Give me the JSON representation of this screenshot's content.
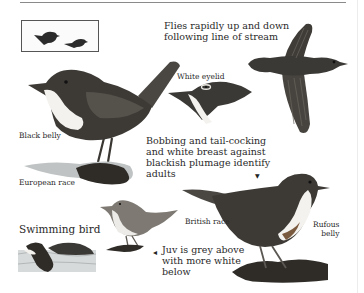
{
  "labels": {
    "flight": [
      "Flies rapidly up and down",
      "following line of stream"
    ],
    "white_eyelid": "White eyelid",
    "black_belly": "Black belly",
    "european_race": "European race",
    "bobbing": [
      "Bobbing and tail-cocking",
      "and white breast against",
      "blackish plumage identify",
      "adults"
    ],
    "british_race": "British race",
    "rufous_belly": [
      "Rufous",
      "belly"
    ],
    "swimming_bird": "Swimming bird",
    "juvenile": [
      "Juv is grey above",
      "with more white",
      "below"
    ]
  },
  "pointers": {
    "adult_marker": "▼",
    "juv_marker": "•",
    "juv_arrow": "◂"
  },
  "colors": {
    "plumage_dark": "#3b3936",
    "plumage_mid": "#5a5650",
    "breast_white": "#f4f2ee",
    "rock": "#2f2c28",
    "water": "#bfc3c3",
    "text": "#2a2a2a",
    "rule": "#8a8a8a"
  },
  "illustrations": [
    {
      "name": "silhouette-thumbnail",
      "caption": ""
    },
    {
      "name": "european-race-adult",
      "caption": "European race"
    },
    {
      "name": "head-detail",
      "caption": "White eyelid"
    },
    {
      "name": "flying-bird",
      "caption": "Flies rapidly up and down following line of stream"
    },
    {
      "name": "british-race-adult",
      "caption": "British race"
    },
    {
      "name": "juvenile-bird",
      "caption": "Juv is grey above with more white below"
    },
    {
      "name": "swimming-bird",
      "caption": "Swimming bird"
    }
  ]
}
